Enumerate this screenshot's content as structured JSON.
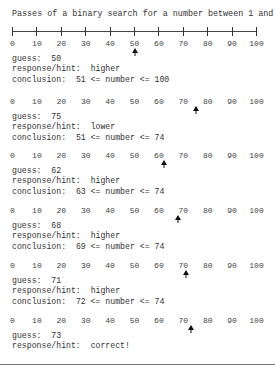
{
  "title": "Passes of a binary search for a number between 1 and 100.",
  "axis": {
    "min": 0,
    "max": 100,
    "tick_labels": [
      "0",
      "10",
      "20",
      "30",
      "40",
      "50",
      "60",
      "70",
      "80",
      "90",
      "100"
    ]
  },
  "labels": {
    "guess": "guess:",
    "response": "response/hint:",
    "conclusion": "conclusion:"
  },
  "passes": [
    {
      "guess": "50",
      "response": "higher",
      "conclusion": "51 <= number <= 100"
    },
    {
      "guess": "75",
      "response": "lower",
      "conclusion": "51 <= number <= 74"
    },
    {
      "guess": "62",
      "response": "higher",
      "conclusion": "63 <= number <= 74"
    },
    {
      "guess": "68",
      "response": "higher",
      "conclusion": "69 <= number <= 74"
    },
    {
      "guess": "71",
      "response": "higher",
      "conclusion": "72 <= number <= 74"
    },
    {
      "guess": "73",
      "response": "correct!",
      "conclusion": ""
    }
  ],
  "colors": {
    "text": "#333333",
    "arrow": "#111111",
    "axis": "#444444"
  }
}
